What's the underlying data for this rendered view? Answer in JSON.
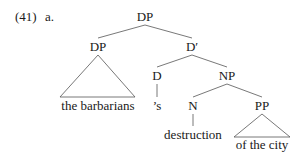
{
  "example": {
    "number": "(41)",
    "sub_label": "a."
  },
  "tree": {
    "root": "DP",
    "specifier": "DP",
    "specifier_yield": "the barbarians",
    "bar": "D′",
    "head": "D",
    "head_word": "’s",
    "complement": "NP",
    "noun": "N",
    "noun_word": "destruction",
    "pp": "PP",
    "pp_yield": "of the city"
  },
  "colors": {
    "text": "#1a1a1a",
    "lines": "#555555",
    "background": "#ffffff"
  }
}
